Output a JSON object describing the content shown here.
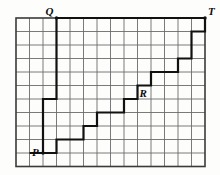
{
  "figure": {
    "name": "lattice-staircase-path-figure",
    "background_color": "#fdfdfb",
    "grid": {
      "columns": 14,
      "rows": 11,
      "cell_size_px": 13.5,
      "origin_x_px": 16,
      "origin_y_px": 18,
      "line_color": "#6b6b6b",
      "line_width_px": 0.9,
      "border_color": "#3a3a3a",
      "border_width_px": 1.6
    },
    "path": {
      "color": "#111111",
      "width_px": 2.2,
      "description": "Monotone staircase lattice path from P up-right to T, with a tall vertical segment rising to Q and a long horizontal segment from Q to T.",
      "points_grid": [
        [
          1.0,
          10.0
        ],
        [
          3.0,
          10.0
        ],
        [
          3.0,
          9.0
        ],
        [
          5.0,
          9.0
        ],
        [
          5.0,
          8.0
        ],
        [
          6.0,
          8.0
        ],
        [
          6.0,
          7.0
        ],
        [
          8.0,
          7.0
        ],
        [
          8.0,
          6.0
        ],
        [
          9.0,
          6.0
        ],
        [
          9.0,
          5.0
        ],
        [
          10.0,
          5.0
        ],
        [
          10.0,
          4.0
        ],
        [
          12.0,
          4.0
        ],
        [
          12.0,
          3.0
        ],
        [
          13.0,
          3.0
        ],
        [
          13.0,
          1.0
        ],
        [
          14.0,
          1.0
        ],
        [
          14.0,
          0.0
        ]
      ],
      "branch_points_grid": [
        [
          2.0,
          10.0
        ],
        [
          2.0,
          6.0
        ],
        [
          3.0,
          6.0
        ],
        [
          3.0,
          0.0
        ],
        [
          14.0,
          0.0
        ]
      ]
    },
    "vertices": [
      {
        "id": "P",
        "label": "P",
        "grid_x": 2.0,
        "grid_y": 10.0,
        "label_offset_x_px": -11,
        "label_offset_y_px": -6,
        "dot": true
      },
      {
        "id": "Q",
        "label": "Q",
        "grid_x": 3.0,
        "grid_y": 0.0,
        "label_offset_x_px": -11,
        "label_offset_y_px": -12,
        "dot": true
      },
      {
        "id": "R",
        "label": "R",
        "grid_x": 9.0,
        "grid_y": 5.0,
        "label_offset_x_px": 2,
        "label_offset_y_px": 2,
        "dot": false
      },
      {
        "id": "T",
        "label": "T",
        "grid_x": 14.0,
        "grid_y": 0.0,
        "label_offset_x_px": 3,
        "label_offset_y_px": -12,
        "dot": true
      }
    ]
  }
}
